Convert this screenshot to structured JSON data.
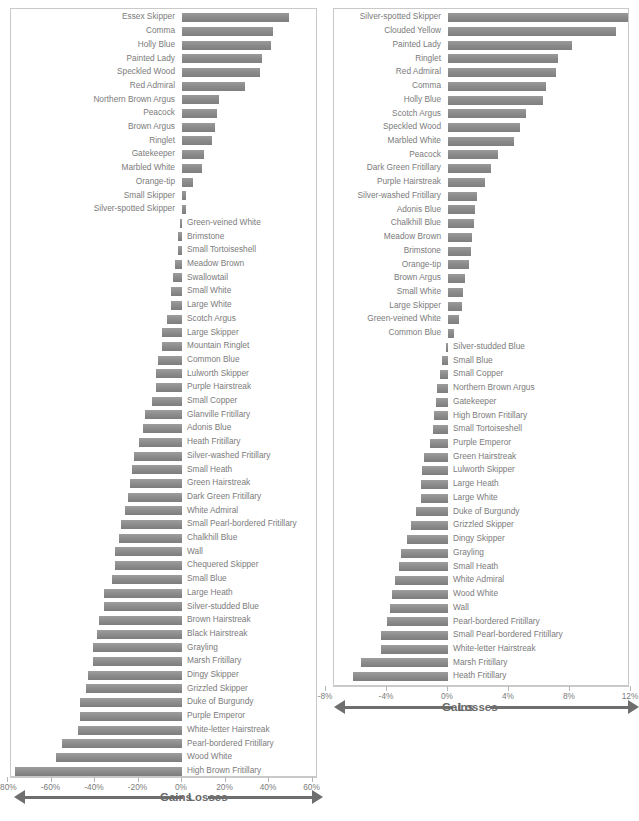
{
  "chart_data": [
    {
      "id": "left",
      "type": "bar",
      "orientation": "horizontal",
      "title": "",
      "xlabel": "",
      "ylabel": "",
      "xlim": [
        -80,
        60
      ],
      "xticks": [
        -80,
        -60,
        -40,
        -20,
        0,
        20,
        40,
        60
      ],
      "xticklabels": [
        "-80%",
        "-60%",
        "-40%",
        "-20%",
        "0%",
        "20%",
        "40%",
        "60%"
      ],
      "grid": false,
      "legend": {
        "left_label": "Losses",
        "right_label": "Gains"
      },
      "categories": [
        "Essex Skipper",
        "Comma",
        "Holly Blue",
        "Painted Lady",
        "Speckled Wood",
        "Red Admiral",
        "Northern Brown Argus",
        "Peacock",
        "Brown Argus",
        "Ringlet",
        "Gatekeeper",
        "Marbled White",
        "Orange-tip",
        "Small Skipper",
        "Silver-spotted Skipper",
        "Green-veined White",
        "Brimstone",
        "Small Tortoiseshell",
        "Meadow Brown",
        "Swallowtail",
        "Small White",
        "Large White",
        "Scotch Argus",
        "Large Skipper",
        "Mountain Ringlet",
        "Common Blue",
        "Lulworth Skipper",
        "Purple Hairstreak",
        "Small Copper",
        "Glanville Fritillary",
        "Adonis Blue",
        "Heath Fritillary",
        "Silver-washed Fritillary",
        "Small Heath",
        "Green Hairstreak",
        "Dark Green Fritillary",
        "White Admiral",
        "Small Pearl-bordered Fritillary",
        "Chalkhill Blue",
        "Wall",
        "Chequered Skipper",
        "Small Blue",
        "Large Heath",
        "Silver-studded Blue",
        "Brown Hairstreak",
        "Black Hairstreak",
        "Grayling",
        "Marsh Fritillary",
        "Dingy Skipper",
        "Grizzled Skipper",
        "Duke of Burgundy",
        "Purple Emperor",
        "White-letter Hairstreak",
        "Pearl-bordered Fritillary",
        "Wood White",
        "High Brown Fritillary"
      ],
      "values": [
        49,
        42,
        41,
        37,
        36,
        29,
        17,
        16,
        15,
        14,
        10,
        9,
        5,
        2,
        2,
        -1,
        -2,
        -2,
        -3,
        -4,
        -5,
        -5,
        -7,
        -9,
        -9,
        -11,
        -12,
        -12,
        -14,
        -17,
        -18,
        -20,
        -22,
        -23,
        -24,
        -25,
        -26,
        -28,
        -29,
        -31,
        -31,
        -32,
        -36,
        -36,
        -38,
        -39,
        -41,
        -41,
        -43,
        -44,
        -47,
        -47,
        -48,
        -55,
        -58,
        -77
      ]
    },
    {
      "id": "right",
      "type": "bar",
      "orientation": "horizontal",
      "title": "",
      "xlabel": "",
      "ylabel": "",
      "xlim": [
        -8,
        12
      ],
      "xticks": [
        -8,
        -4,
        0,
        4,
        8,
        12
      ],
      "xticklabels": [
        "-8%",
        "-4%",
        "0%",
        "4%",
        "8%",
        "12%"
      ],
      "grid": false,
      "legend": {
        "left_label": "Losses",
        "right_label": "Gains"
      },
      "categories": [
        "Silver-spotted Skipper",
        "Clouded Yellow",
        "Painted Lady",
        "Ringlet",
        "Red Admiral",
        "Comma",
        "Holly Blue",
        "Scotch Argus",
        "Speckled Wood",
        "Marbled White",
        "Peacock",
        "Dark Green Fritillary",
        "Purple Hairstreak",
        "Silver-washed Fritillary",
        "Adonis Blue",
        "Chalkhill Blue",
        "Meadow Brown",
        "Brimstone",
        "Orange-tip",
        "Brown Argus",
        "Small White",
        "Large Skipper",
        "Green-veined White",
        "Common Blue",
        "Silver-studded Blue",
        "Small Blue",
        "Small Copper",
        "Northern Brown Argus",
        "Gatekeeper",
        "High Brown Fritillary",
        "Small Tortoiseshell",
        "Purple Emperor",
        "Green Hairstreak",
        "Lulworth Skipper",
        "Large Heath",
        "Large White",
        "Duke of Burgundy",
        "Grizzled Skipper",
        "Dingy Skipper",
        "Grayling",
        "Small Heath",
        "White Admiral",
        "Wood White",
        "Wall",
        "Pearl-bordered Fritillary",
        "Small Pearl-bordered Fritillary",
        "White-letter Hairstreak",
        "Marsh Fritillary",
        "Heath Fritillary"
      ],
      "values": [
        11.9,
        11.0,
        8.1,
        7.2,
        7.1,
        6.4,
        6.2,
        5.1,
        4.7,
        4.3,
        3.3,
        2.8,
        2.4,
        1.9,
        1.8,
        1.7,
        1.6,
        1.5,
        1.4,
        1.1,
        1.0,
        0.9,
        0.7,
        0.4,
        -0.1,
        -0.4,
        -0.5,
        -0.7,
        -0.8,
        -0.9,
        -1.0,
        -1.2,
        -1.6,
        -1.7,
        -1.8,
        -1.8,
        -2.1,
        -2.4,
        -2.7,
        -3.1,
        -3.2,
        -3.5,
        -3.7,
        -3.8,
        -4.0,
        -4.4,
        -4.4,
        -5.7,
        -6.2
      ]
    }
  ]
}
